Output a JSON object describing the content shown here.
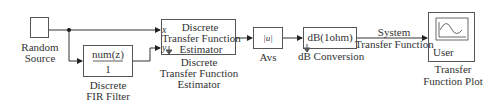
{
  "diagram": {
    "blocks": {
      "random_source": {
        "label_line1": "Random",
        "label_line2": "Source"
      },
      "fir_filter": {
        "numerator": "num(z)",
        "denominator": "1",
        "label_line1": "Discrete",
        "label_line2": "FIR Filter"
      },
      "estimator": {
        "inner_line1": "Discrete",
        "inner_line2": "Transfer Function",
        "inner_line3": "Estimator",
        "port_x": "x",
        "port_y": "y",
        "label_line1": "Discrete",
        "label_line2": "Transfer Function",
        "label_line3": "Estimator"
      },
      "abs": {
        "inner": "|u|",
        "label": "Avs"
      },
      "db_conversion": {
        "inner": "dB(1ohm)",
        "label": "dB Conversion"
      },
      "user_plot": {
        "inner": "User",
        "label_line1": "Transfer",
        "label_line2": "Function Plot"
      }
    },
    "signals": {
      "system_tf_line1": "System",
      "system_tf_line2": "Transfer Function"
    }
  }
}
